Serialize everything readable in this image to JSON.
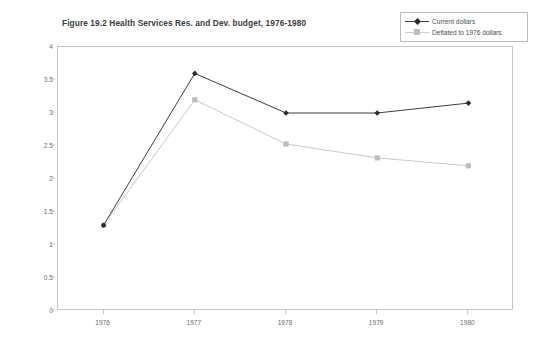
{
  "chart_data": {
    "type": "line",
    "title": "Figure 19.2 Health Services Res. and Dev. budget, 1976-1980",
    "xlabel": "",
    "ylabel": "Millions of dollars",
    "categories": [
      "1976",
      "1977",
      "1978",
      "1979",
      "1980"
    ],
    "ylim": [
      0,
      4
    ],
    "ytick_labels": [
      "0",
      "0.5",
      "1",
      "1.5",
      "2",
      "2.5",
      "3",
      "3.5",
      "4"
    ],
    "ytick_values": [
      0,
      0.5,
      1,
      1.5,
      2,
      2.5,
      3,
      3.5,
      4
    ],
    "grid": false,
    "legend_position": "top-right",
    "series": [
      {
        "name": "Current dollars",
        "values": [
          1.3,
          3.6,
          3.0,
          3.0,
          3.15
        ],
        "color": "#3f3f3f",
        "marker": "diamond"
      },
      {
        "name": "Deflated to 1976 dollars",
        "values": [
          1.3,
          3.2,
          2.53,
          2.32,
          2.2
        ],
        "color": "#c9c9c9",
        "marker": "square"
      }
    ]
  },
  "legend": {
    "items": [
      {
        "label": "Current dollars",
        "key": "diamond-dark-line-key"
      },
      {
        "label": "Deflated to 1976 dollars",
        "key": "square-light-line-key"
      }
    ]
  },
  "colors": {
    "series_current": "#3f3f3f",
    "series_deflated": "#c9c9c9",
    "axis": "#c3c7ca",
    "text": "#5b5f62"
  }
}
